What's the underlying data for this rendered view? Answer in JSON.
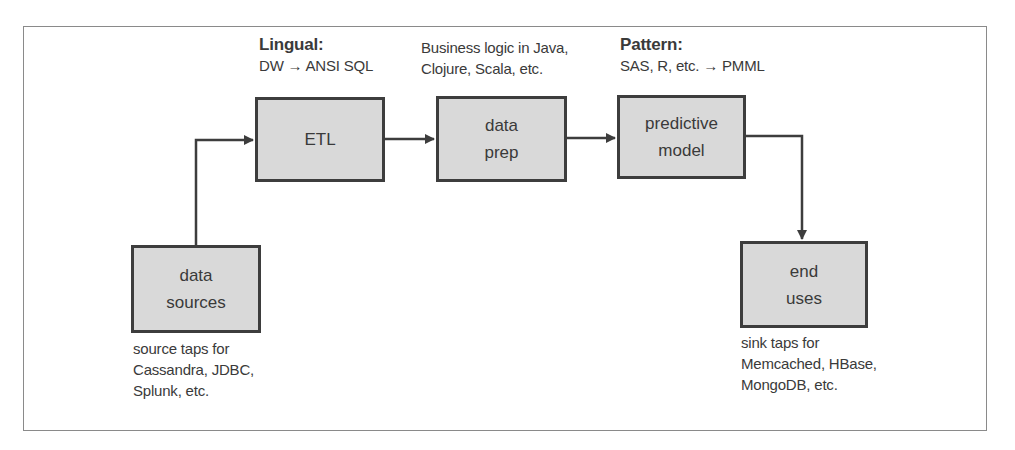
{
  "diagram": {
    "nodes": [
      {
        "id": "data_sources",
        "lines": [
          "data",
          "sources"
        ]
      },
      {
        "id": "etl",
        "lines": [
          "ETL"
        ]
      },
      {
        "id": "data_prep",
        "lines": [
          "data",
          "prep"
        ]
      },
      {
        "id": "predictive_model",
        "lines": [
          "predictive",
          "model"
        ]
      },
      {
        "id": "end_uses",
        "lines": [
          "end",
          "uses"
        ]
      }
    ],
    "annotations": {
      "etl": {
        "title": "Lingual:",
        "line1": "DW",
        "arrow": "→",
        "line1_end": "ANSI SQL"
      },
      "data_prep": {
        "line1": "Business logic in Java,",
        "line2": "Clojure, Scala, etc."
      },
      "predictive_model": {
        "title": "Pattern:",
        "line1": "SAS, R, etc.",
        "arrow": "→",
        "line1_end": "PMML"
      },
      "data_sources": {
        "line1": "source taps for",
        "line2": "Cassandra, JDBC,",
        "line3": "Splunk, etc."
      },
      "end_uses": {
        "line1": "sink taps for",
        "line2": "Memcached, HBase,",
        "line3": "MongoDB, etc."
      }
    },
    "edges": [
      {
        "from": "data_sources",
        "to": "etl"
      },
      {
        "from": "etl",
        "to": "data_prep"
      },
      {
        "from": "data_prep",
        "to": "predictive_model"
      },
      {
        "from": "predictive_model",
        "to": "end_uses"
      }
    ],
    "colors": {
      "box_fill": "#d9d9d9",
      "box_border": "#3d3d3d",
      "line": "#3d3d3d",
      "frame": "#8a8a8a"
    }
  }
}
